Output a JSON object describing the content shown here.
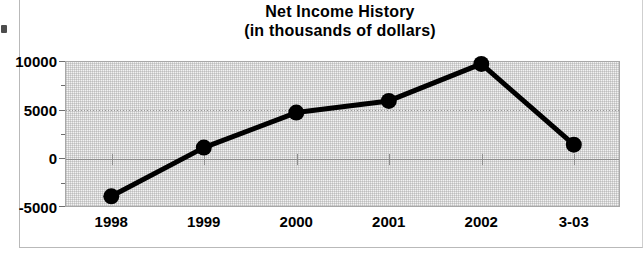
{
  "chart_data": {
    "type": "line",
    "title": "Net Income History",
    "subtitle": "(in thousands of dollars)",
    "xlabel": "",
    "ylabel": "",
    "categories": [
      "1998",
      "1999",
      "2000",
      "2001",
      "2002",
      "3-03"
    ],
    "values": [
      -3900,
      1100,
      4700,
      5900,
      9700,
      1400
    ],
    "series": [
      {
        "name": "Net Income",
        "values": [
          -3900,
          1100,
          4700,
          5900,
          9700,
          1400
        ]
      }
    ],
    "ylim": [
      -5000,
      10000
    ],
    "ytick_labels": [
      "10000",
      "5000",
      "0",
      "-5000"
    ],
    "ytick_values": [
      10000,
      5000,
      0,
      -5000
    ],
    "yminor_values": [
      7500,
      2500,
      -2500
    ],
    "grid": true,
    "legend": "none",
    "line_color": "#000000",
    "marker_color": "#000000",
    "plot_background": "#f2f2f2"
  },
  "figure": {
    "title_main": "Net Income History",
    "title_sub": "(in thousands of dollars)"
  }
}
